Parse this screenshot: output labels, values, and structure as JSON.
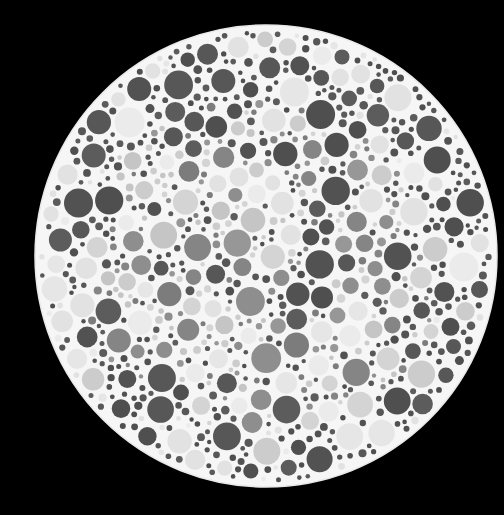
{
  "image": {
    "subject": "Color vision test plate (pseudoisochromatic dot pattern), grayscale",
    "background_color": "#000000",
    "width": 504,
    "height": 515
  },
  "plate": {
    "center_x": 266,
    "center_y": 256,
    "radius": 231,
    "fill_color": "#f6f6f6",
    "edge_color": "#e9e9e9"
  },
  "dots": {
    "seed": 20240517,
    "palette": {
      "dark": [
        "#4f4f4f",
        "#575757",
        "#5c5c5c",
        "#525252"
      ],
      "mid": [
        "#858585",
        "#8e8e8e",
        "#979797",
        "#7c7c7c"
      ],
      "light": [
        "#cccccc",
        "#d4d4d4",
        "#c5c5c5"
      ],
      "faint": [
        "#e6e6e6",
        "#ebebeb",
        "#e2e2e2"
      ]
    },
    "figure_region": {
      "center_x": 262,
      "center_y": 300,
      "radius_x": 175,
      "radius_y": 130
    },
    "large_count": 190,
    "small_count": 620,
    "large_radius_range": [
      7,
      15
    ],
    "small_radius_range": [
      2.2,
      4.6
    ]
  }
}
